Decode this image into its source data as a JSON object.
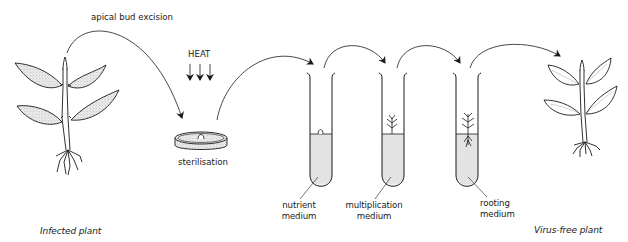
{
  "diagram": {
    "steps": [
      {
        "id": "infected-plant",
        "label": "Infected plant"
      },
      {
        "id": "excision",
        "label": "apical bud excision"
      },
      {
        "id": "heat",
        "label": "HEAT"
      },
      {
        "id": "sterilisation",
        "label": "sterilisation"
      },
      {
        "id": "nutrient",
        "label_line1": "nutrient",
        "label_line2": "medium"
      },
      {
        "id": "multiplication",
        "label_line1": "multiplication",
        "label_line2": "medium"
      },
      {
        "id": "rooting",
        "label_line1": "rooting",
        "label_line2": "medium"
      },
      {
        "id": "virus-free-plant",
        "label": "Virus-free plant"
      }
    ],
    "colors": {
      "ink": "#1a1a1a",
      "medium_fill": "#e4e4e4",
      "leaf_stipple": "#d9d9d9",
      "background": "#ffffff"
    }
  }
}
